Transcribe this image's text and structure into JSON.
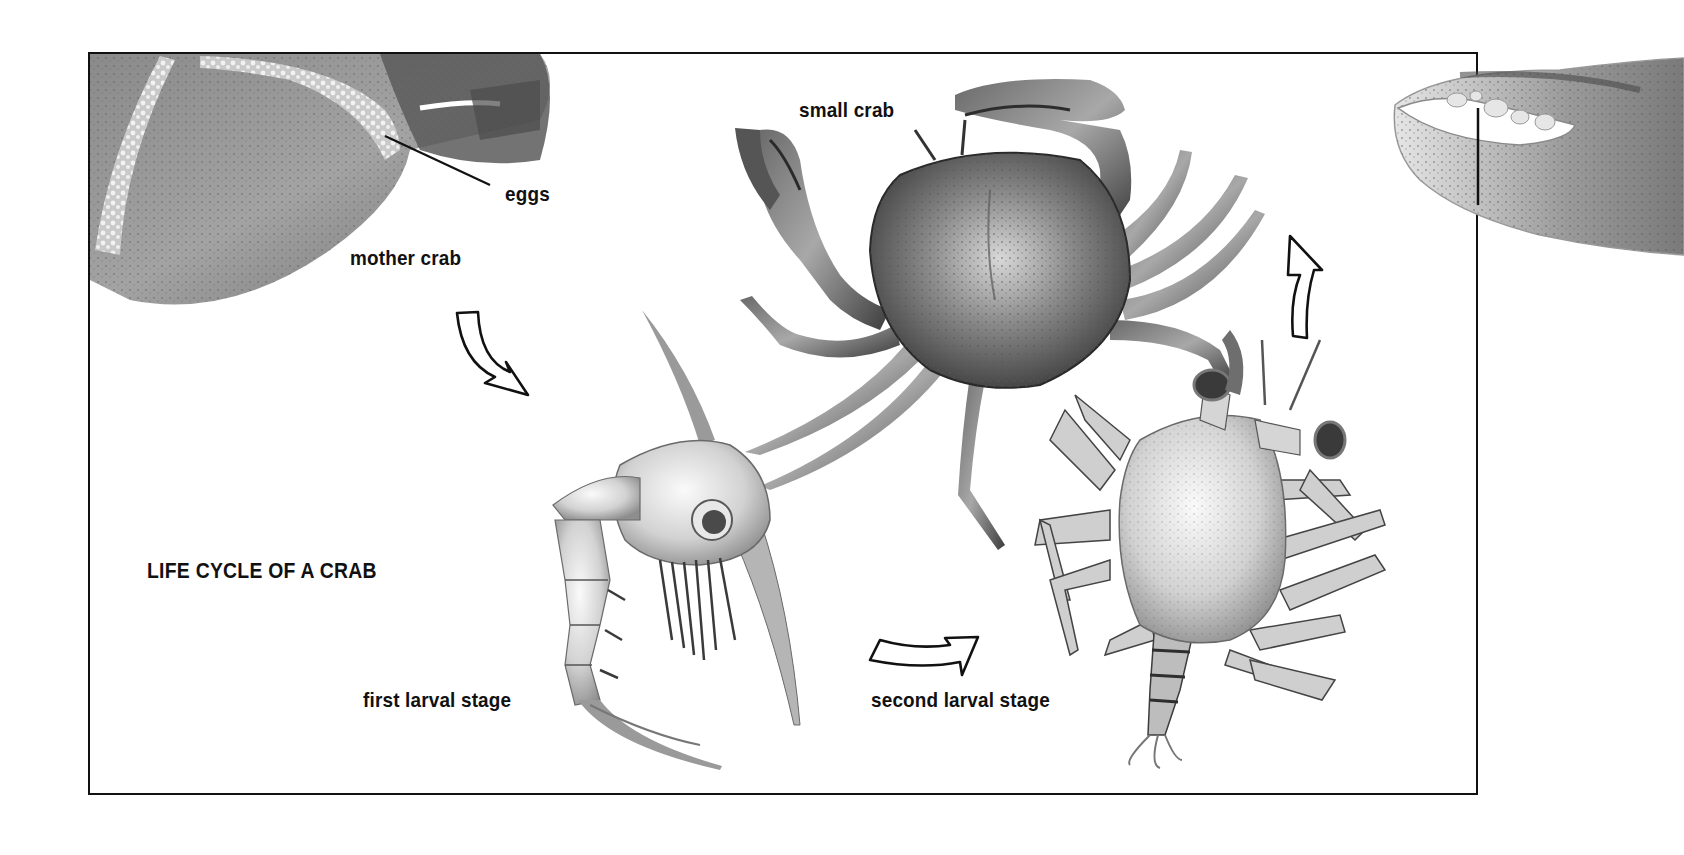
{
  "diagram": {
    "title": "LIFE CYCLE OF A CRAB",
    "labels": {
      "eggs": "eggs",
      "mother_crab": "mother crab",
      "small_crab": "small crab",
      "first_larval_stage": "first larval stage",
      "second_larval_stage": "second larval stage"
    },
    "stages": [
      {
        "order": 1,
        "name": "mother crab",
        "detail": "eggs"
      },
      {
        "order": 2,
        "name": "first larval stage"
      },
      {
        "order": 3,
        "name": "second larval stage"
      },
      {
        "order": 4,
        "name": "small crab"
      }
    ],
    "arrows": [
      {
        "from": "mother crab",
        "to": "first larval stage",
        "icon": "curved-arrow-down-right-icon"
      },
      {
        "from": "first larval stage",
        "to": "second larval stage",
        "icon": "curved-arrow-right-icon"
      },
      {
        "from": "second larval stage",
        "to": "small crab",
        "icon": "curved-arrow-up-icon"
      }
    ],
    "colors": {
      "ink": "#111111",
      "background": "#ffffff",
      "shell_dark": "#4a4a4a",
      "shell_mid": "#8a8a8a",
      "larva_light": "#d9d9d9"
    }
  }
}
